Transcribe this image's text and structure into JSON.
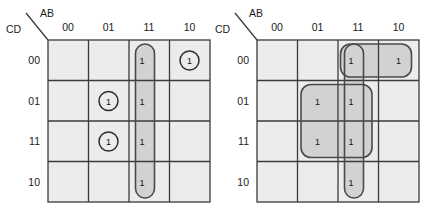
{
  "figure": {
    "type": "karnaugh-map-pair",
    "background_color": "#ffffff",
    "cell_fill": "#ececec",
    "group_fill": "#d2d2d2",
    "grid_line_color": "#3b3b3b",
    "group_outline_color": "#4a4a4a",
    "text_color": "#1b1b1b"
  },
  "maps": [
    {
      "id": "left",
      "corner": {
        "top_label": "AB",
        "bottom_label": "CD"
      },
      "column_headers": [
        "00",
        "01",
        "11",
        "10"
      ],
      "row_headers": [
        "00",
        "01",
        "11",
        "10"
      ],
      "cells": [
        {
          "row": "00",
          "col": "00",
          "value": ""
        },
        {
          "row": "00",
          "col": "01",
          "value": ""
        },
        {
          "row": "00",
          "col": "11",
          "value": "1"
        },
        {
          "row": "00",
          "col": "10",
          "value": "1"
        },
        {
          "row": "01",
          "col": "00",
          "value": ""
        },
        {
          "row": "01",
          "col": "01",
          "value": "1"
        },
        {
          "row": "01",
          "col": "11",
          "value": "1"
        },
        {
          "row": "01",
          "col": "10",
          "value": ""
        },
        {
          "row": "11",
          "col": "00",
          "value": ""
        },
        {
          "row": "11",
          "col": "01",
          "value": "1"
        },
        {
          "row": "11",
          "col": "11",
          "value": "1"
        },
        {
          "row": "11",
          "col": "10",
          "value": ""
        },
        {
          "row": "10",
          "col": "00",
          "value": ""
        },
        {
          "row": "10",
          "col": "01",
          "value": ""
        },
        {
          "row": "10",
          "col": "11",
          "value": "1"
        },
        {
          "row": "10",
          "col": "10",
          "value": ""
        }
      ],
      "circled_ones": [
        {
          "row": "00",
          "col": "10"
        },
        {
          "row": "01",
          "col": "01"
        },
        {
          "row": "11",
          "col": "01"
        }
      ],
      "groups": [
        {
          "name": "column-11-vertical-group",
          "shape": "rounded-rect",
          "col_start": "11",
          "col_end": "11",
          "row_start": "00",
          "row_end": "10"
        }
      ]
    },
    {
      "id": "right",
      "corner": {
        "top_label": "AB",
        "bottom_label": "CD"
      },
      "column_headers": [
        "00",
        "01",
        "11",
        "10"
      ],
      "row_headers": [
        "00",
        "01",
        "11",
        "10"
      ],
      "cells": [
        {
          "row": "00",
          "col": "00",
          "value": ""
        },
        {
          "row": "00",
          "col": "01",
          "value": ""
        },
        {
          "row": "00",
          "col": "11",
          "value": "1"
        },
        {
          "row": "00",
          "col": "10",
          "value": "1"
        },
        {
          "row": "01",
          "col": "00",
          "value": ""
        },
        {
          "row": "01",
          "col": "01",
          "value": "1"
        },
        {
          "row": "01",
          "col": "11",
          "value": "1"
        },
        {
          "row": "01",
          "col": "10",
          "value": ""
        },
        {
          "row": "11",
          "col": "00",
          "value": ""
        },
        {
          "row": "11",
          "col": "01",
          "value": "1"
        },
        {
          "row": "11",
          "col": "11",
          "value": "1"
        },
        {
          "row": "11",
          "col": "10",
          "value": ""
        },
        {
          "row": "10",
          "col": "00",
          "value": ""
        },
        {
          "row": "10",
          "col": "01",
          "value": ""
        },
        {
          "row": "10",
          "col": "11",
          "value": "1"
        },
        {
          "row": "10",
          "col": "10",
          "value": ""
        }
      ],
      "circled_ones": [],
      "groups": [
        {
          "name": "row-00-horizontal-group",
          "shape": "rounded-rect",
          "col_start": "11",
          "col_end": "10",
          "row_start": "00",
          "row_end": "00"
        },
        {
          "name": "center-square-group",
          "shape": "rounded-rect",
          "col_start": "01",
          "col_end": "11",
          "row_start": "01",
          "row_end": "11"
        },
        {
          "name": "column-11-vertical-group",
          "shape": "rounded-rect",
          "col_start": "11",
          "col_end": "11",
          "row_start": "00",
          "row_end": "10"
        }
      ]
    }
  ]
}
